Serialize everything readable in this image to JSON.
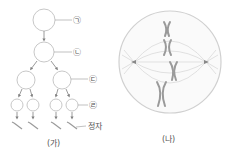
{
  "figure_a": {
    "caption": "(가)",
    "labels": {
      "stage_1": "㉠",
      "stage_2": "㉡",
      "stage_3": "㉢",
      "stage_4": "㉣",
      "sperm": "정자"
    }
  },
  "figure_b": {
    "caption": "(나)"
  },
  "colors": {
    "stroke": "#c8c8c8",
    "arrow": "#808080",
    "chromosome": "#9a9a9a",
    "text": "#555555"
  }
}
